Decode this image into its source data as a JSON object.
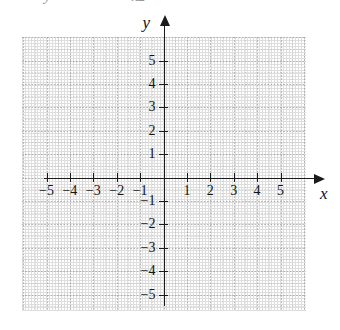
{
  "figure": {
    "kind": "blank-cartesian-grid",
    "background_color": "#ffffff",
    "axis_color": "#1b1b1b",
    "grid_color": "#a0a0a0",
    "label_color": "#121212"
  },
  "top_cutoff": {
    "glyph_left": "y",
    "glyph_right": "x2"
  },
  "axes": {
    "x_label": "x",
    "y_label": "y",
    "x_arrow": "arrow-right",
    "y_arrow": "arrow-up"
  },
  "chart_data": {
    "type": "scatter",
    "title": "",
    "subtitle": "",
    "xlabel": "x",
    "ylabel": "y",
    "xlim": [
      -5,
      5
    ],
    "ylim": [
      -5,
      5
    ],
    "xticks": [
      -5,
      -4,
      -3,
      -2,
      -1,
      1,
      2,
      3,
      4,
      5
    ],
    "yticks": [
      -5,
      -4,
      -3,
      -2,
      -1,
      1,
      2,
      3,
      4,
      5
    ],
    "xticklabels": [
      "−5",
      "−4",
      "−3",
      "−2",
      "−1",
      "1",
      "2",
      "3",
      "4",
      "5"
    ],
    "yticklabels": [
      "−5",
      "−4",
      "−3",
      "−2",
      "−1",
      "1",
      "2",
      "3",
      "4",
      "5"
    ],
    "grid": true,
    "grid_style": "dotted",
    "grid_minor": true,
    "legend": null,
    "series": [],
    "values": [],
    "annotations": [],
    "origin_label": ""
  },
  "ticks": {
    "x_negative": [
      "−5",
      "−4",
      "−3",
      "−2",
      "−1"
    ],
    "x_positive": [
      "1",
      "2",
      "3",
      "4",
      "5"
    ],
    "y_positive": [
      "5",
      "4",
      "3",
      "2",
      "1"
    ],
    "y_negative": [
      "−1",
      "−2",
      "−3",
      "−4",
      "−5"
    ]
  }
}
